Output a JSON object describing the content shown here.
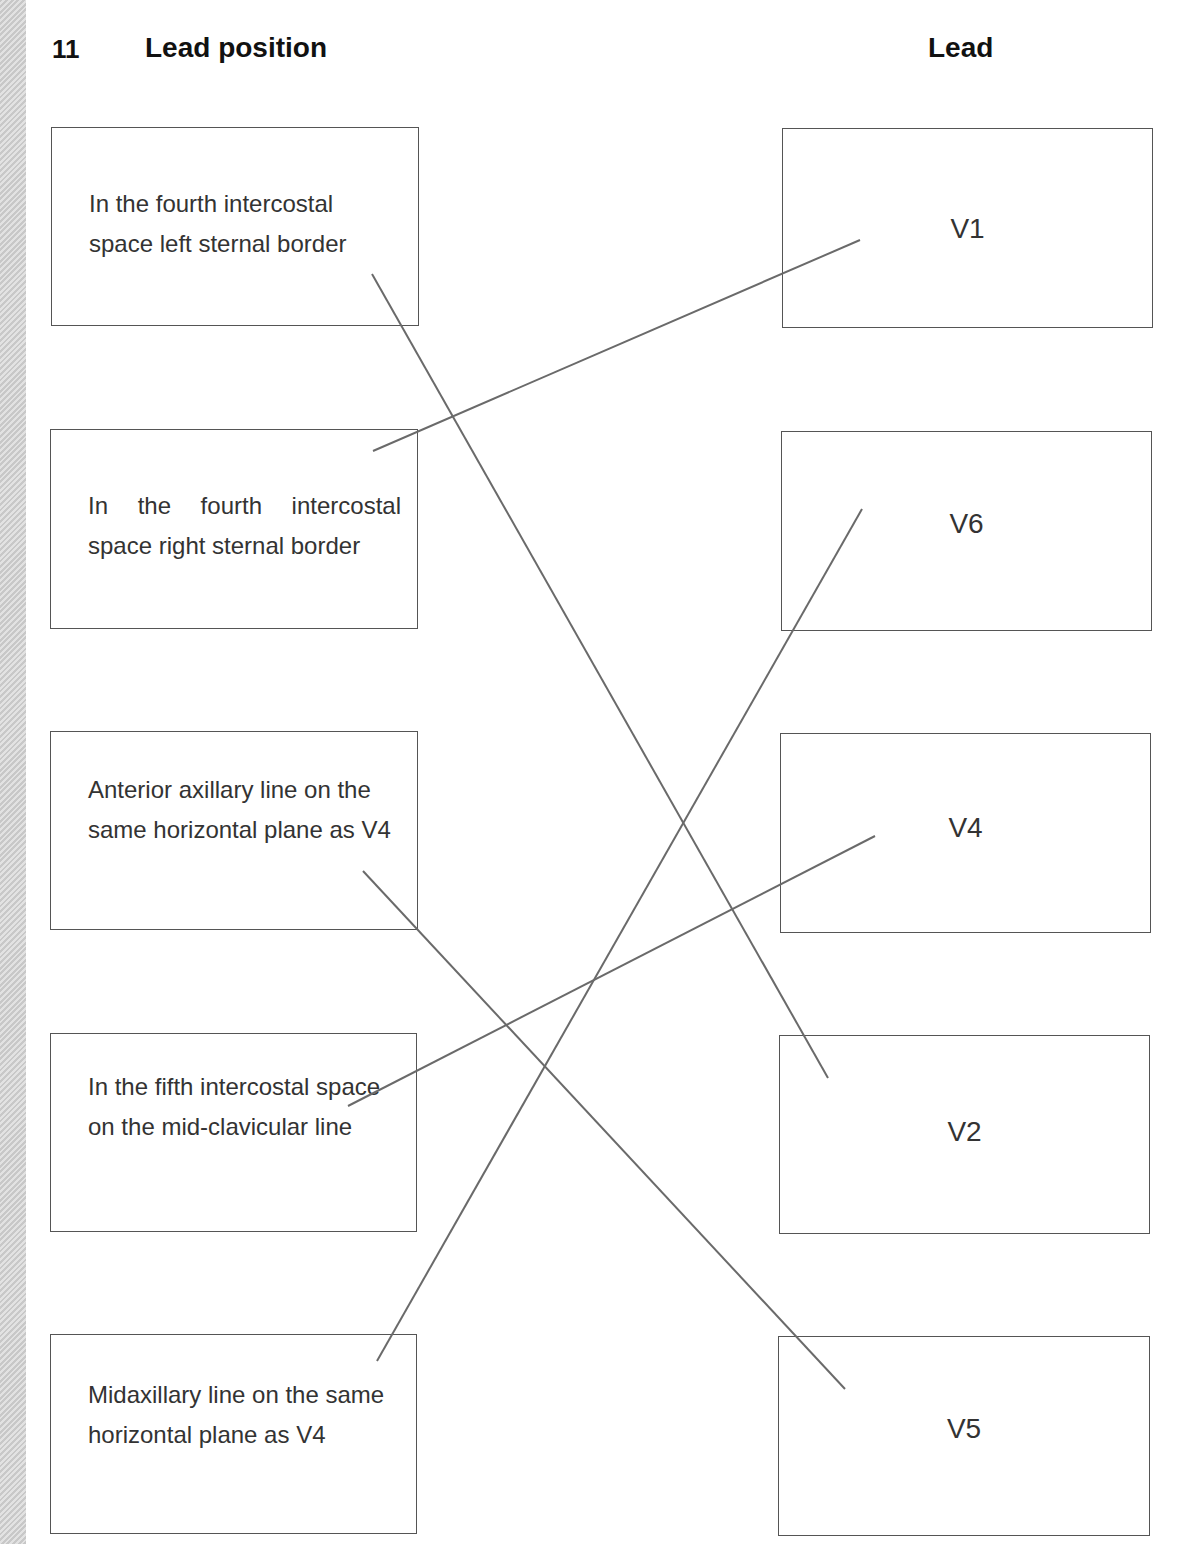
{
  "question_number": "11",
  "left_header": "Lead position",
  "right_header": "Lead",
  "left_items": [
    {
      "text": "In the fourth intercostal space left sternal border"
    },
    {
      "text": "In the fourth intercostal space right sternal border"
    },
    {
      "text": "Anterior axillary line on the same horizontal plane as V4"
    },
    {
      "text": "In the fifth intercostal space on the mid-clavicular line"
    },
    {
      "text": "Midaxillary line on the same horizontal plane as V4"
    }
  ],
  "right_items": [
    {
      "text": "V1"
    },
    {
      "text": "V6"
    },
    {
      "text": "V4"
    },
    {
      "text": "V2"
    },
    {
      "text": "V5"
    }
  ],
  "connections": [
    {
      "from": "In the fourth intercostal space left sternal border",
      "to": "V2"
    },
    {
      "from": "In the fourth intercostal space right sternal border",
      "to": "V1"
    },
    {
      "from": "Anterior axillary line on the same horizontal plane as V4",
      "to": "V5"
    },
    {
      "from": "In the fifth intercostal space on the mid-clavicular line",
      "to": "V4"
    },
    {
      "from": "Midaxillary line on the same horizontal plane as V4",
      "to": "V6"
    }
  ],
  "line_color": "#6a6a6a"
}
